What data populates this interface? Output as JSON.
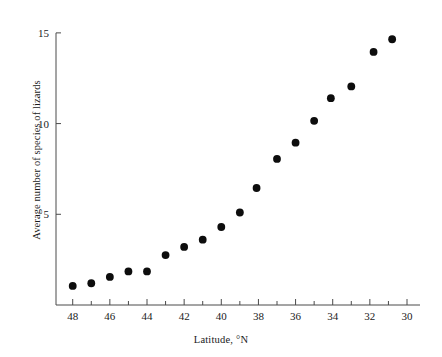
{
  "chart_data": {
    "type": "scatter",
    "title": "",
    "xlabel": "Latitude, °N",
    "ylabel": "Average number of species of lizards",
    "xlim": [
      48.9,
      29.3
    ],
    "ylim": [
      0,
      15.6
    ],
    "x_reversed": true,
    "grid": false,
    "legend": null,
    "x_tick_labels": [
      "48",
      "46",
      "44",
      "42",
      "40",
      "38",
      "36",
      "34",
      "32",
      "30"
    ],
    "x_tick_label_values": [
      48,
      46,
      44,
      42,
      40,
      38,
      36,
      34,
      32,
      30
    ],
    "x_minor_ticks": [
      47,
      45,
      43,
      41,
      39,
      37,
      35,
      33,
      31
    ],
    "y_tick_labels": [
      "5",
      "10",
      "15"
    ],
    "y_tick_label_values": [
      5,
      10,
      15
    ],
    "marker": "filled-circle",
    "marker_color": "#0d0d0d",
    "marker_size_px": 5.2,
    "axis_color": "#4a4a4a",
    "background_color": "#ffffff",
    "points": [
      {
        "x": 48.0,
        "y": 1.05
      },
      {
        "x": 47.0,
        "y": 1.2
      },
      {
        "x": 46.0,
        "y": 1.55
      },
      {
        "x": 45.0,
        "y": 1.85
      },
      {
        "x": 44.0,
        "y": 1.85
      },
      {
        "x": 43.0,
        "y": 2.75
      },
      {
        "x": 42.0,
        "y": 3.2
      },
      {
        "x": 41.0,
        "y": 3.6
      },
      {
        "x": 40.0,
        "y": 4.3
      },
      {
        "x": 39.0,
        "y": 5.1
      },
      {
        "x": 38.1,
        "y": 6.45
      },
      {
        "x": 37.0,
        "y": 8.05
      },
      {
        "x": 36.0,
        "y": 8.95
      },
      {
        "x": 35.0,
        "y": 10.15
      },
      {
        "x": 34.1,
        "y": 11.4
      },
      {
        "x": 33.0,
        "y": 12.05
      },
      {
        "x": 31.8,
        "y": 13.95
      },
      {
        "x": 30.8,
        "y": 14.65
      }
    ]
  },
  "axes": {
    "x_axis_name": "latitude-axis",
    "y_axis_name": "species-count-axis"
  }
}
